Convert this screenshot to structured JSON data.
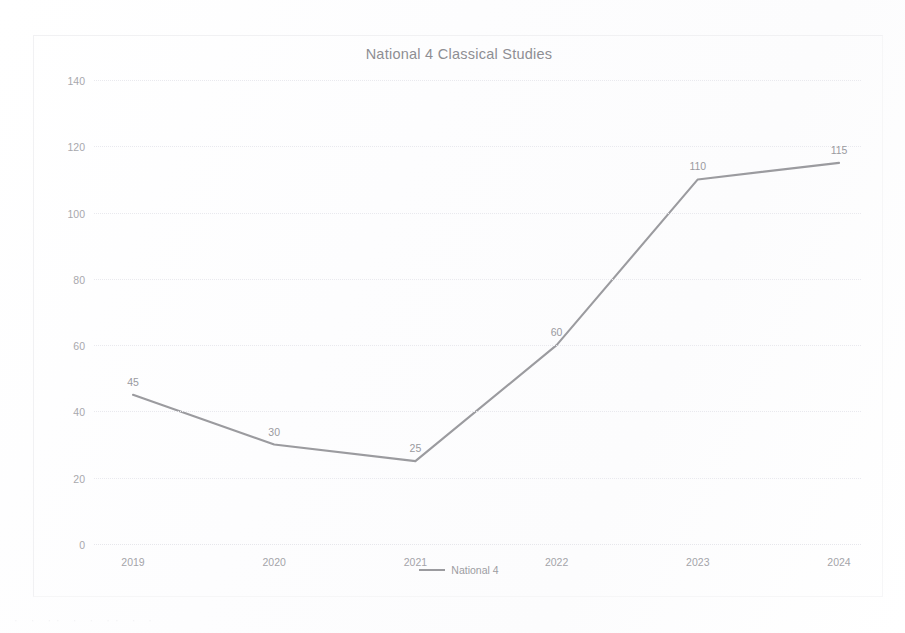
{
  "chart_data": {
    "type": "line",
    "title": "National 4 Classical Studies",
    "xlabel": "",
    "ylabel": "",
    "categories": [
      "2019",
      "2020",
      "2021",
      "2022",
      "2023",
      "2024"
    ],
    "series": [
      {
        "name": "National 4",
        "values": [
          45,
          30,
          25,
          60,
          110,
          115
        ],
        "color": "#9b9b9f"
      }
    ],
    "point_labels": [
      "45",
      "30",
      "25",
      "60",
      "110",
      "115"
    ],
    "ylim": [
      0,
      140
    ],
    "ytick_values": [
      0,
      20,
      40,
      60,
      80,
      100,
      120,
      140
    ],
    "ytick_labels": [
      "0",
      "20",
      "40",
      "60",
      "80",
      "100",
      "120",
      "140"
    ],
    "grid": true,
    "grid_axis": "y",
    "grid_style": "dotted",
    "legend": true,
    "legend_position": "bottom",
    "legend_entries": [
      "National 4"
    ],
    "background_color": "#ffffff",
    "text_color": "#9a9a9f",
    "grid_color": "#e9e9ee"
  },
  "artifact": {
    "text": "·  ·   ··  ·  ·     ··   ·    ·"
  }
}
